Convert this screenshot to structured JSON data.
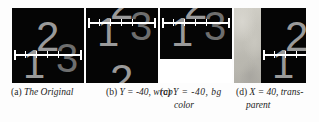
{
  "figure": {
    "name": "image-offset-examples",
    "background_color": "#fdfdfd"
  },
  "panels": [
    {
      "id": "a",
      "name": "panel-original",
      "canvas_color": "#050505",
      "digit_color": "#9a9a9a",
      "ruler_color": "#ffffff",
      "digits": {
        "one": "1",
        "two": "2",
        "three": "3"
      },
      "offset_x": 0,
      "offset_y": 0,
      "fill_mode": "none"
    },
    {
      "id": "b",
      "name": "panel-wrap",
      "canvas_color": "#050505",
      "digit_color": "#9a9a9a",
      "ruler_color": "#ffffff",
      "digits": {
        "one": "1",
        "two": "2",
        "three": "3"
      },
      "offset_x": 0,
      "offset_y": -40,
      "fill_mode": "wrap"
    },
    {
      "id": "c",
      "name": "panel-bg-color",
      "canvas_color": "#050505",
      "digit_color": "#9a9a9a",
      "ruler_color": "#ffffff",
      "fill_color": "#ffffff",
      "digits": {
        "one": "1",
        "two": "2",
        "three": "3"
      },
      "offset_x": 0,
      "offset_y": -40,
      "fill_mode": "bg-color"
    },
    {
      "id": "d",
      "name": "panel-transparent",
      "canvas_color": "#050505",
      "digit_color": "#9a9a9a",
      "ruler_color": "#ffffff",
      "digits": {
        "one": "1",
        "two": "2",
        "three": "3"
      },
      "offset_x": 40,
      "offset_y": 0,
      "fill_mode": "transparent"
    }
  ],
  "captions": {
    "a": {
      "tag": "(a)",
      "body": "The Original",
      "line2": ""
    },
    "b": {
      "tag": "(b)",
      "body": "Y = -40, wrap",
      "line2": ""
    },
    "c": {
      "tag": "(c)",
      "body": "Y  =  -40,  bg",
      "line2": "color"
    },
    "d": {
      "tag": "(d)",
      "body": "X = 40, trans-",
      "line2": "parent"
    }
  }
}
